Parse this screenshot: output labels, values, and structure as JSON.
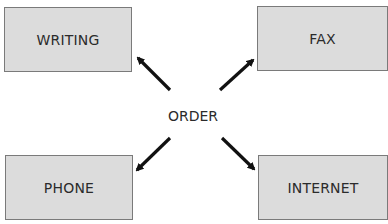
{
  "diagram": {
    "center": {
      "label": "ORDER",
      "x": 193,
      "y": 116
    },
    "nodes": [
      {
        "id": "writing",
        "label": "WRITING",
        "x": 4,
        "y": 7,
        "w": 128,
        "h": 65
      },
      {
        "id": "fax",
        "label": "FAX",
        "x": 257,
        "y": 6,
        "w": 131,
        "h": 65
      },
      {
        "id": "phone",
        "label": "PHONE",
        "x": 5,
        "y": 155,
        "w": 128,
        "h": 65
      },
      {
        "id": "internet",
        "label": "INTERNET",
        "x": 258,
        "y": 155,
        "w": 130,
        "h": 65
      }
    ],
    "arrows": [
      {
        "from": "order",
        "to": "writing",
        "x1": 170,
        "y1": 90,
        "x2": 136,
        "y2": 56
      },
      {
        "from": "order",
        "to": "fax",
        "x1": 220,
        "y1": 90,
        "x2": 255,
        "y2": 58
      },
      {
        "from": "order",
        "to": "phone",
        "x1": 170,
        "y1": 138,
        "x2": 135,
        "y2": 172
      },
      {
        "from": "order",
        "to": "internet",
        "x1": 222,
        "y1": 138,
        "x2": 256,
        "y2": 171
      }
    ],
    "colors": {
      "box_fill": "#dcdcdc",
      "box_border": "#7a7a7a",
      "arrow": "#111111",
      "text": "#2b2b2b"
    }
  }
}
